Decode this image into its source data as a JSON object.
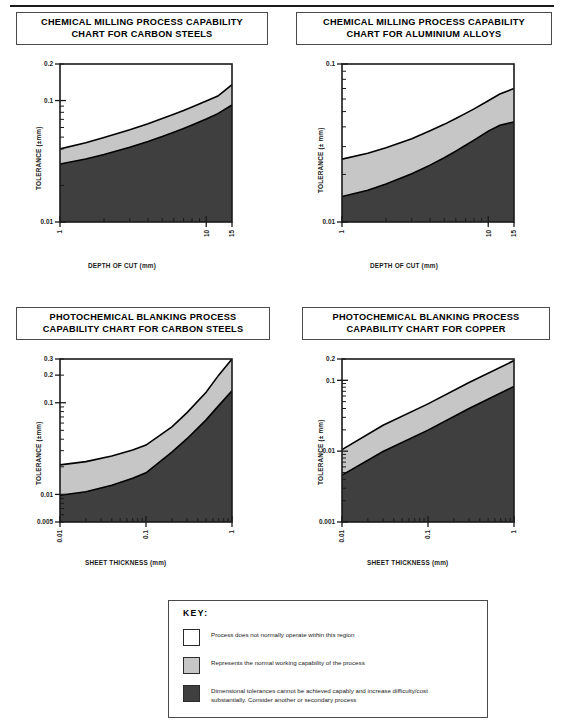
{
  "page": {
    "background": "#ffffff",
    "rule_color": "#1b1b1b"
  },
  "legend": {
    "title": "KEY:",
    "items": [
      {
        "swatch": "white",
        "color": "#ffffff",
        "text": "Process does not normally operate within this region"
      },
      {
        "swatch": "grey",
        "color": "#c6c6c6",
        "text": "Represents the normal working capability of the process"
      },
      {
        "swatch": "dark",
        "color": "#3f3f3f",
        "text": "Dimensional tolerances cannot be achieved capably and increase difficulty/cost substantially. Consider another or secondary process"
      }
    ]
  },
  "colors": {
    "region_white": "#ffffff",
    "region_grey": "#c6c6c6",
    "region_dark": "#3f3f3f",
    "axis": "#1a1a1a",
    "curve": "#000000"
  },
  "chart_data": [
    {
      "id": "chemical-milling-carbon-steels",
      "type": "area",
      "title": "CHEMICAL MILLING PROCESS CAPABILITY CHART FOR CARBON STEELS",
      "title_lines": [
        "CHEMICAL MILLING PROCESS CAPABILITY",
        "CHART FOR CARBON STEELS"
      ],
      "xlabel": "DEPTH OF CUT  (mm)",
      "ylabel": "TOLERANCE (±mm)",
      "xscale": "log",
      "yscale": "log",
      "xlim": [
        1,
        15
      ],
      "ylim": [
        0.01,
        0.2
      ],
      "xticklabels": [
        "1",
        "10",
        "15"
      ],
      "xtickvalues": [
        1,
        10,
        15
      ],
      "yticklabels": [
        "0.2",
        "0.1",
        "0.01"
      ],
      "ytickvalues": [
        0.2,
        0.1,
        0.01
      ],
      "grid": false,
      "legend_position": "external-key-box",
      "series": [
        {
          "name": "upper boundary (white / grey)",
          "x": [
            1,
            1.5,
            2,
            3,
            4,
            5,
            6,
            7,
            8,
            10,
            12,
            15
          ],
          "y": [
            0.04,
            0.045,
            0.0497,
            0.0575,
            0.0645,
            0.071,
            0.077,
            0.0828,
            0.0885,
            0.099,
            0.109,
            0.135
          ]
        },
        {
          "name": "lower boundary (grey / dark)",
          "x": [
            1,
            1.5,
            2,
            3,
            4,
            5,
            6,
            7,
            8,
            10,
            12,
            15
          ],
          "y": [
            0.03,
            0.033,
            0.036,
            0.0412,
            0.046,
            0.0505,
            0.0548,
            0.059,
            0.063,
            0.0705,
            0.078,
            0.092
          ]
        }
      ]
    },
    {
      "id": "chemical-milling-aluminium-alloys",
      "type": "area",
      "title": "CHEMICAL MILLING PROCESS CAPABILITY CHART FOR ALUMINIUM ALLOYS",
      "title_lines": [
        "CHEMICAL MILLING PROCESS CAPABILITY",
        "CHART FOR ALUMINIUM ALLOYS"
      ],
      "xlabel": "DEPTH OF CUT  (mm)",
      "ylabel": "TOLERANCE (± mm)",
      "xscale": "log",
      "yscale": "log",
      "xlim": [
        1,
        15
      ],
      "ylim": [
        0.01,
        0.1
      ],
      "xticklabels": [
        "1",
        "10",
        "15"
      ],
      "xtickvalues": [
        1,
        10,
        15
      ],
      "yticklabels": [
        "0.1",
        "0.01"
      ],
      "ytickvalues": [
        0.1,
        0.01
      ],
      "grid": false,
      "legend_position": "external-key-box",
      "series": [
        {
          "name": "upper boundary (white / grey)",
          "x": [
            1,
            1.5,
            2,
            3,
            4,
            5,
            6,
            7,
            8,
            10,
            12,
            15
          ],
          "y": [
            0.025,
            0.0272,
            0.0295,
            0.0337,
            0.0378,
            0.0415,
            0.0452,
            0.0487,
            0.052,
            0.0585,
            0.0645,
            0.07
          ]
        },
        {
          "name": "lower boundary (grey / dark)",
          "x": [
            1,
            1.5,
            2,
            3,
            4,
            5,
            6,
            7,
            8,
            10,
            12,
            15
          ],
          "y": [
            0.0145,
            0.0159,
            0.0174,
            0.0202,
            0.0229,
            0.0255,
            0.0281,
            0.0306,
            0.033,
            0.0376,
            0.041,
            0.043
          ]
        }
      ]
    },
    {
      "id": "photochemical-blanking-carbon-steels",
      "type": "area",
      "title": "PHOTOCHEMICAL BLANKING PROCESS CAPABILITY CHART FOR CARBON STEELS",
      "title_lines": [
        "PHOTOCHEMICAL BLANKING PROCESS",
        "CAPABILITY CHART FOR CARBON STEELS"
      ],
      "xlabel": "SHEET THICKNESS (mm)",
      "ylabel": "TOLERANCE (±mm)",
      "xscale": "log",
      "yscale": "log",
      "xlim": [
        0.01,
        1
      ],
      "ylim": [
        0.005,
        0.3
      ],
      "xticklabels": [
        "0.01",
        "0.1",
        "1"
      ],
      "xtickvalues": [
        0.01,
        0.1,
        1
      ],
      "yticklabels": [
        "0.3",
        "0.2",
        "0.1",
        "0.01",
        "0.005"
      ],
      "ytickvalues": [
        0.3,
        0.2,
        0.1,
        0.01,
        0.005
      ],
      "grid": false,
      "legend_position": "external-key-box",
      "series": [
        {
          "name": "upper boundary (white / grey)",
          "x": [
            0.01,
            0.02,
            0.04,
            0.07,
            0.1,
            0.2,
            0.3,
            0.5,
            0.7,
            1.0
          ],
          "y": [
            0.021,
            0.0228,
            0.0262,
            0.0305,
            0.0345,
            0.0545,
            0.078,
            0.13,
            0.2,
            0.3
          ]
        },
        {
          "name": "lower boundary (grey / dark)",
          "x": [
            0.01,
            0.02,
            0.04,
            0.07,
            0.1,
            0.2,
            0.3,
            0.5,
            0.7,
            1.0
          ],
          "y": [
            0.0098,
            0.0107,
            0.0126,
            0.015,
            0.0172,
            0.029,
            0.0405,
            0.065,
            0.093,
            0.135
          ]
        }
      ]
    },
    {
      "id": "photochemical-blanking-copper",
      "type": "area",
      "title": "PHOTOCHEMICAL BLANKING PROCESS CAPABILITY CHART FOR COPPER",
      "title_lines": [
        "PHOTOCHEMICAL BLANKING PROCESS",
        "CAPABILITY CHART FOR COPPER"
      ],
      "xlabel": "SHEET THICKNESS (mm)",
      "ylabel": "TOLERANCE (± mm)",
      "xscale": "log",
      "yscale": "log",
      "xlim": [
        0.01,
        1
      ],
      "ylim": [
        0.001,
        0.2
      ],
      "xticklabels": [
        "0.01",
        "0.1",
        "1"
      ],
      "xtickvalues": [
        0.01,
        0.1,
        1
      ],
      "yticklabels": [
        "0.2",
        "0.1",
        "0.01",
        "0.001"
      ],
      "ytickvalues": [
        0.2,
        0.1,
        0.01,
        0.001
      ],
      "grid": false,
      "legend_position": "external-key-box",
      "series": [
        {
          "name": "upper boundary (white / grey)",
          "x": [
            0.01,
            0.03,
            0.1,
            0.3,
            1.0
          ],
          "y": [
            0.0105,
            0.0232,
            0.0465,
            0.093,
            0.19
          ]
        },
        {
          "name": "lower boundary (grey / dark)",
          "x": [
            0.01,
            0.03,
            0.1,
            0.3,
            1.0
          ],
          "y": [
            0.0046,
            0.0099,
            0.0198,
            0.04,
            0.082
          ]
        }
      ]
    }
  ]
}
